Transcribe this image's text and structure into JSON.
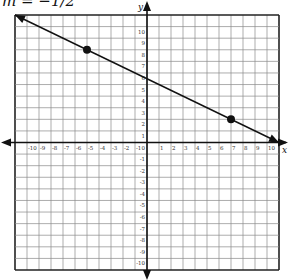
{
  "chart_data": {
    "type": "line",
    "title": "m = −1/2",
    "xlabel": "x",
    "ylabel": "y",
    "xlim": [
      -11,
      11
    ],
    "ylim": [
      -11,
      11
    ],
    "grid": true,
    "x_ticks": [
      -10,
      -9,
      -8,
      -7,
      -6,
      -5,
      -4,
      -3,
      -2,
      -1,
      1,
      2,
      3,
      4,
      5,
      6,
      7,
      8,
      9,
      10
    ],
    "y_ticks": [
      10,
      9,
      8,
      7,
      6,
      5,
      4,
      3,
      2,
      1,
      0,
      -1,
      -2,
      -3,
      -4,
      -5,
      -6,
      -7,
      -8,
      -9,
      -10
    ],
    "tick_labels_x": [
      "-10",
      "-9",
      "-8",
      "-7",
      "-6",
      "-5",
      "-4",
      "-3",
      "-2",
      "-1",
      "1",
      "2",
      "3",
      "4",
      "5",
      "6",
      "7",
      "8",
      "9",
      "10"
    ],
    "tick_labels_y": [
      "10",
      "9",
      "8",
      "7",
      "6",
      "5",
      "4",
      "3",
      "2",
      "1",
      "0",
      "-1",
      "-2",
      "-3",
      "-4",
      "-5",
      "-6",
      "-7",
      "-8",
      "-9",
      "-10"
    ],
    "series": [
      {
        "name": "line",
        "slope": -0.5,
        "intercept": 5.5,
        "x": [
          -11,
          11
        ],
        "y": [
          11,
          0
        ]
      }
    ],
    "points": [
      {
        "x": -5,
        "y": 8
      },
      {
        "x": 7,
        "y": 2
      }
    ]
  }
}
